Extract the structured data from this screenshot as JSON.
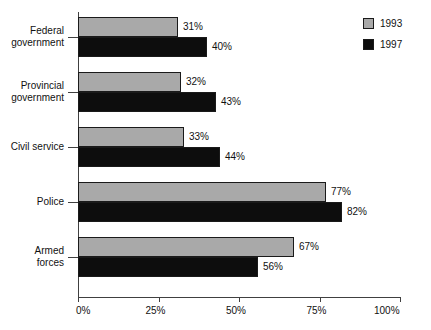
{
  "chart_data": {
    "type": "bar",
    "orientation": "horizontal",
    "title": "",
    "xlabel": "",
    "ylabel": "",
    "xlim": [
      0,
      100
    ],
    "grid": false,
    "legend_position": "top-right",
    "categories": [
      "Federal government",
      "Provincial government",
      "Civil service",
      "Police",
      "Armed forces"
    ],
    "category_lines": [
      [
        "Federal",
        "government"
      ],
      [
        "Provincial",
        "government"
      ],
      [
        "Civil service"
      ],
      [
        "Police"
      ],
      [
        "Armed",
        "forces"
      ]
    ],
    "series": [
      {
        "name": "1993",
        "color": "#a9a9a9",
        "values": [
          31,
          32,
          33,
          77,
          67
        ],
        "labels": [
          "31%",
          "32%",
          "33%",
          "77%",
          "67%"
        ]
      },
      {
        "name": "1997",
        "color": "#0d0d0d",
        "values": [
          40,
          43,
          44,
          82,
          56
        ],
        "labels": [
          "40%",
          "43%",
          "44%",
          "82%",
          "56%"
        ]
      }
    ],
    "xticks": [
      0,
      25,
      50,
      75,
      100
    ],
    "xtick_labels": [
      "0%",
      "25%",
      "50%",
      "75%",
      "100%"
    ]
  },
  "legend": {
    "items": [
      {
        "label": "1993",
        "color": "#a9a9a9"
      },
      {
        "label": "1997",
        "color": "#0d0d0d"
      }
    ]
  }
}
